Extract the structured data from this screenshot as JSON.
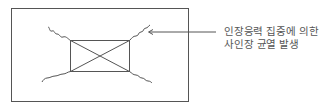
{
  "diagram": {
    "type": "structural-crack-diagram",
    "frame": {
      "x": 11,
      "y": 8,
      "width": 177,
      "height": 93
    },
    "opening": {
      "x": 70,
      "y": 40,
      "width": 59,
      "height": 31,
      "cross_marked": true
    },
    "colors": {
      "line": "#555555",
      "text": "#555555",
      "background": "#ffffff"
    },
    "annotation": {
      "line1": "인장응력 집중에 의한",
      "line2": "사인장 균열 발생",
      "arrow_target": "top-right-crack"
    }
  }
}
